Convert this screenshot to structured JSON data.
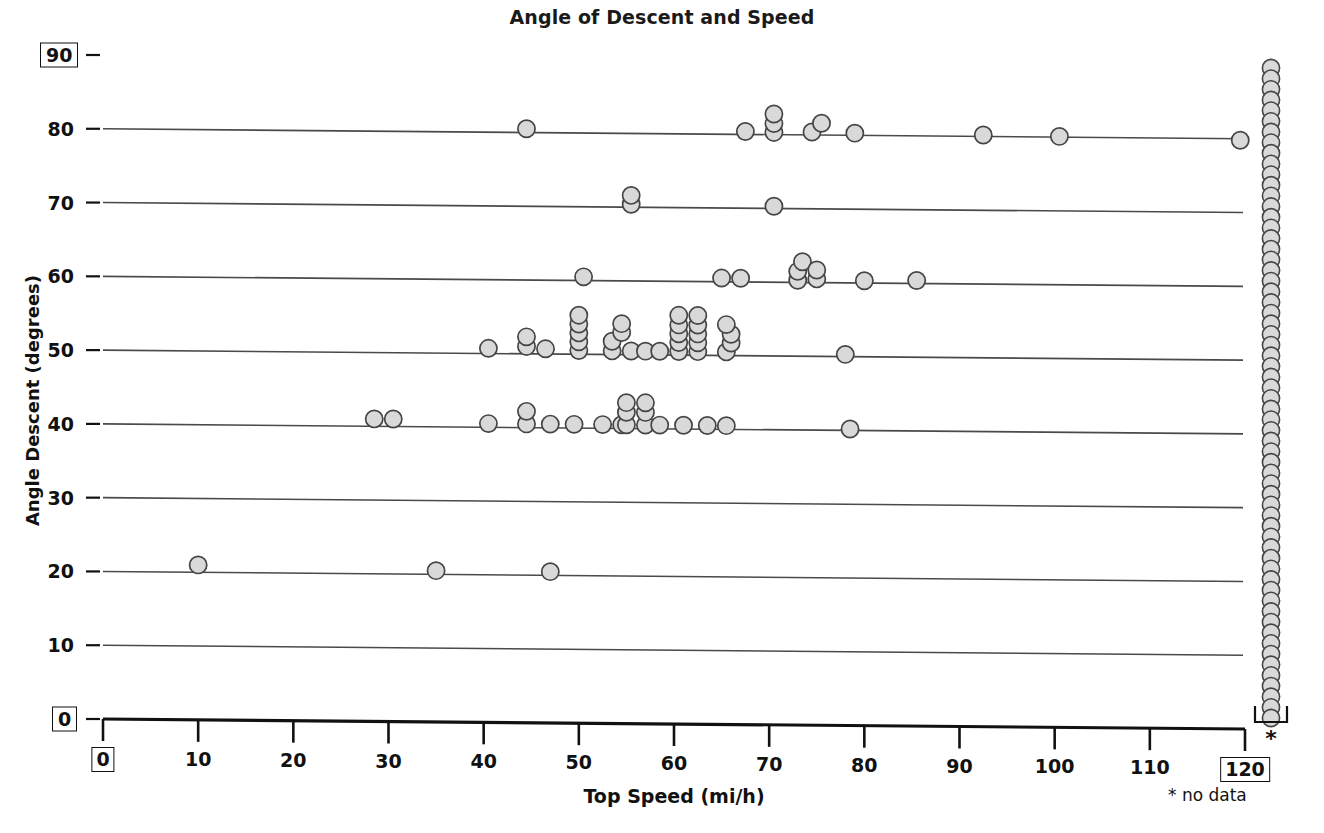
{
  "chart_data": {
    "type": "scatter",
    "title": "Angle of Descent and Speed",
    "xlabel": "Top Speed (mi/h)",
    "ylabel": "Angle Descent (degrees)",
    "xlim": [
      0,
      120
    ],
    "ylim": [
      0,
      90
    ],
    "grid": "horizontal-rules-at-y-ticks",
    "legend": "none",
    "annotations": [
      "* no data"
    ],
    "x_ticks": [
      "0",
      "10",
      "20",
      "30",
      "40",
      "50",
      "60",
      "70",
      "80",
      "90",
      "100",
      "110",
      "120"
    ],
    "x_tick_values": [
      0,
      10,
      20,
      30,
      40,
      50,
      60,
      70,
      80,
      90,
      100,
      110,
      120
    ],
    "x_boxed_ticks": [
      0,
      120
    ],
    "y_ticks": [
      "0",
      "10",
      "20",
      "30",
      "40",
      "50",
      "60",
      "70",
      "80",
      "90"
    ],
    "y_tick_values": [
      0,
      10,
      20,
      30,
      40,
      50,
      60,
      70,
      80,
      90
    ],
    "y_boxed_ticks": [
      0,
      90
    ],
    "marker": {
      "shape": "circle",
      "fill": "#d9d9d9",
      "stroke": "#454545",
      "diameter_px": 17
    },
    "points": [
      {
        "x": 10.0,
        "y": 21
      },
      {
        "x": 35.0,
        "y": 20.5
      },
      {
        "x": 47.0,
        "y": 20.5
      },
      {
        "x": 28.5,
        "y": 41
      },
      {
        "x": 30.5,
        "y": 41
      },
      {
        "x": 40.5,
        "y": 40.5
      },
      {
        "x": 44.5,
        "y": 40.5
      },
      {
        "x": 44.5,
        "y": 42.2
      },
      {
        "x": 47.0,
        "y": 40.5
      },
      {
        "x": 49.5,
        "y": 40.5
      },
      {
        "x": 52.5,
        "y": 40.5
      },
      {
        "x": 54.5,
        "y": 40.5
      },
      {
        "x": 55.0,
        "y": 40.5
      },
      {
        "x": 55.0,
        "y": 42.2
      },
      {
        "x": 55.0,
        "y": 43.5
      },
      {
        "x": 57.0,
        "y": 40.5
      },
      {
        "x": 57.0,
        "y": 42.2
      },
      {
        "x": 57.0,
        "y": 43.5
      },
      {
        "x": 58.5,
        "y": 40.5
      },
      {
        "x": 61.0,
        "y": 40.5
      },
      {
        "x": 63.5,
        "y": 40.5
      },
      {
        "x": 65.5,
        "y": 40.5
      },
      {
        "x": 78.5,
        "y": 40.2
      },
      {
        "x": 40.5,
        "y": 50.7
      },
      {
        "x": 44.5,
        "y": 51.0
      },
      {
        "x": 44.5,
        "y": 52.3
      },
      {
        "x": 46.5,
        "y": 50.7
      },
      {
        "x": 50.0,
        "y": 50.5
      },
      {
        "x": 50.0,
        "y": 51.7
      },
      {
        "x": 50.0,
        "y": 52.9
      },
      {
        "x": 50.0,
        "y": 54.1
      },
      {
        "x": 50.0,
        "y": 55.3
      },
      {
        "x": 53.5,
        "y": 50.5
      },
      {
        "x": 53.5,
        "y": 51.8
      },
      {
        "x": 54.5,
        "y": 53.0
      },
      {
        "x": 54.5,
        "y": 54.2
      },
      {
        "x": 55.5,
        "y": 50.5
      },
      {
        "x": 57.0,
        "y": 50.5
      },
      {
        "x": 58.5,
        "y": 50.5
      },
      {
        "x": 60.5,
        "y": 50.5
      },
      {
        "x": 60.5,
        "y": 51.7
      },
      {
        "x": 60.5,
        "y": 52.9
      },
      {
        "x": 60.5,
        "y": 54.1
      },
      {
        "x": 60.5,
        "y": 55.4
      },
      {
        "x": 62.5,
        "y": 50.5
      },
      {
        "x": 62.5,
        "y": 51.7
      },
      {
        "x": 62.5,
        "y": 52.9
      },
      {
        "x": 62.5,
        "y": 54.1
      },
      {
        "x": 62.5,
        "y": 55.4
      },
      {
        "x": 65.5,
        "y": 50.5
      },
      {
        "x": 66.0,
        "y": 51.7
      },
      {
        "x": 66.0,
        "y": 52.9
      },
      {
        "x": 65.5,
        "y": 54.2
      },
      {
        "x": 78.0,
        "y": 50.3
      },
      {
        "x": 50.5,
        "y": 60.5
      },
      {
        "x": 65.0,
        "y": 60.5
      },
      {
        "x": 67.0,
        "y": 60.5
      },
      {
        "x": 73.0,
        "y": 60.3
      },
      {
        "x": 73.0,
        "y": 61.5
      },
      {
        "x": 73.5,
        "y": 62.8
      },
      {
        "x": 75.0,
        "y": 60.5
      },
      {
        "x": 75.0,
        "y": 61.7
      },
      {
        "x": 80.0,
        "y": 60.3
      },
      {
        "x": 85.5,
        "y": 60.4
      },
      {
        "x": 55.5,
        "y": 70.4
      },
      {
        "x": 55.5,
        "y": 71.6
      },
      {
        "x": 70.5,
        "y": 70.3
      },
      {
        "x": 44.5,
        "y": 80.5
      },
      {
        "x": 67.5,
        "y": 80.4
      },
      {
        "x": 70.5,
        "y": 80.3
      },
      {
        "x": 70.5,
        "y": 81.5
      },
      {
        "x": 70.5,
        "y": 82.8
      },
      {
        "x": 74.5,
        "y": 80.4
      },
      {
        "x": 75.5,
        "y": 81.6
      },
      {
        "x": 79.0,
        "y": 80.3
      },
      {
        "x": 92.5,
        "y": 80.2
      },
      {
        "x": 100.5,
        "y": 80.1
      },
      {
        "x": 119.5,
        "y": 79.8
      }
    ],
    "no_data_column": {
      "label": "*",
      "legend_text": "* no data",
      "count": 62,
      "note": "dense vertical stack of markers plotted outside the x-axis range"
    }
  }
}
